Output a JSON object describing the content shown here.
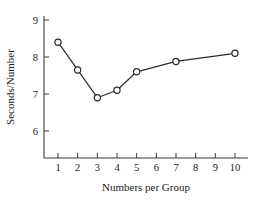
{
  "chart_data": {
    "type": "line",
    "title": "",
    "xlabel": "Numbers per Group",
    "ylabel": "Seconds/Number",
    "x": [
      1,
      2,
      3,
      4,
      5,
      7,
      10
    ],
    "values": [
      8.4,
      7.65,
      6.9,
      7.1,
      7.6,
      7.88,
      8.1
    ],
    "xticks": [
      1,
      2,
      3,
      4,
      5,
      6,
      7,
      8,
      9,
      10
    ],
    "xticklabels": [
      "1",
      "2",
      "3",
      "4",
      "5",
      "6",
      "7",
      "8",
      "9",
      "10"
    ],
    "yticks": [
      6,
      7,
      8,
      9
    ],
    "yticklabels": [
      "6",
      "7",
      "8",
      "9"
    ],
    "xlim": [
      0.45,
      10.55
    ],
    "ylim": [
      5.05,
      9.35
    ],
    "grid": false,
    "legend": false,
    "marker": "open-circle",
    "line_color": "#2b2b2b",
    "marker_face_color": "#ffffff",
    "axis_color": "#3a3a3a",
    "background": "#ffffff"
  }
}
